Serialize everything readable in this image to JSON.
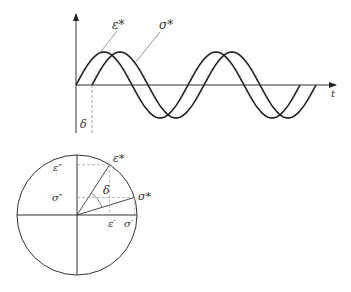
{
  "figure": {
    "type": "phase-lag diagram",
    "top_plot": {
      "time_axis_label": "t",
      "curves": [
        {
          "name": "strain",
          "label": "ε*",
          "start_x": 76,
          "phase_offset": 0
        },
        {
          "name": "stress",
          "label": "σ*",
          "start_x": 92,
          "phase_offset": 16
        }
      ],
      "phase_lag_label": "δ",
      "amplitude_px": 33,
      "period_px": 112,
      "cycles": 2
    },
    "phasor_plot": {
      "labels": {
        "strain_vector": "ε*",
        "stress_vector": "σ*",
        "strain_imag": "ε″",
        "stress_imag": "σ″",
        "strain_real": "ε′",
        "stress_real": "σ′",
        "angle": "δ"
      },
      "strain_angle_deg": 57,
      "stress_angle_deg": 17
    }
  },
  "colors": {
    "line": "#333333",
    "dashed": "#888888",
    "background": "#ffffff"
  }
}
